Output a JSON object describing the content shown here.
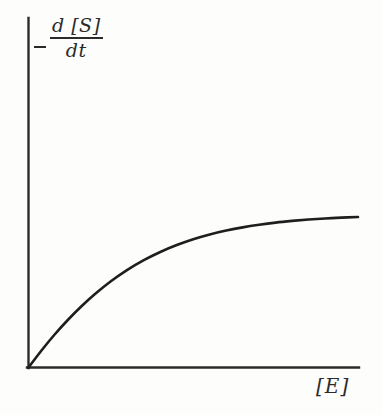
{
  "figure": {
    "name": "enzyme-kinetics-saturation-plot",
    "background_color": "#fdfdfc",
    "ink_color": "#2b2b2b"
  },
  "axes": {
    "y_label": {
      "minus_sign": "−",
      "numerator": "d [S]",
      "denominator": "dt",
      "full_text": "− d[S]/dt"
    },
    "x_label": {
      "text": "[E]"
    }
  },
  "chart_data": {
    "type": "line",
    "title": "",
    "subtitle": "",
    "xlabel": "[E]",
    "ylabel": "- d[S]/dt",
    "grid": false,
    "legend": false,
    "xlim": [
      0,
      1
    ],
    "ylim": [
      0,
      1
    ],
    "axis_ticks": {
      "x": [],
      "y": []
    },
    "annotations": [],
    "series": [
      {
        "name": "rate vs enzyme concentration",
        "color": "#1e1e1e",
        "line_width": 2.6,
        "x": [
          0.0,
          0.04,
          0.08,
          0.12,
          0.16,
          0.2,
          0.25,
          0.3,
          0.35,
          0.4,
          0.45,
          0.5,
          0.55,
          0.6,
          0.65,
          0.7,
          0.75,
          0.8,
          0.85,
          0.9,
          0.95,
          1.0
        ],
        "y": [
          0.0,
          0.112,
          0.216,
          0.31,
          0.396,
          0.474,
          0.56,
          0.634,
          0.697,
          0.75,
          0.795,
          0.833,
          0.864,
          0.889,
          0.91,
          0.927,
          0.941,
          0.952,
          0.961,
          0.968,
          0.973,
          0.977
        ]
      }
    ]
  }
}
